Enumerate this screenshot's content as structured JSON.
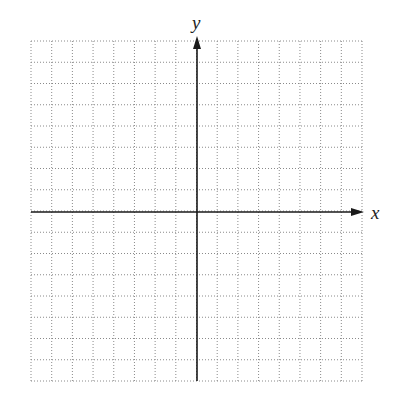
{
  "diagram": {
    "type": "coordinate-grid",
    "x_axis_label": "x",
    "y_axis_label": "y",
    "grid": {
      "columns": 16,
      "rows": 16,
      "left": 31,
      "top": 41,
      "right": 362,
      "bottom": 381,
      "line_style": "dotted",
      "line_color": "#8a8a8a"
    },
    "axes": {
      "origin_x": 197,
      "origin_y": 212,
      "color": "#1a1a1a",
      "x_arrow_tip": 364,
      "y_arrow_tip": 36
    }
  }
}
